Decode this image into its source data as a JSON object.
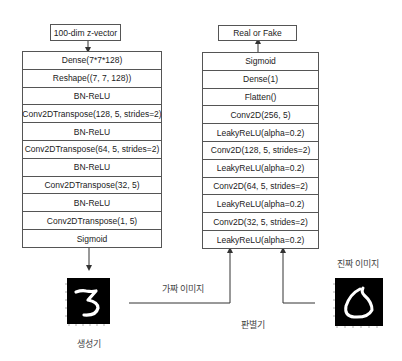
{
  "generator": {
    "input_label": "100-dim z-vector",
    "layers": [
      "Dense(7*7*128)",
      "Reshape((7, 7, 128))",
      "BN-ReLU",
      "Conv2DTranspose(128, 5, strides=2)",
      "BN-ReLU",
      "Conv2DTranspose(64, 5, strides=2)",
      "BN-ReLU",
      "Conv2DTranspose(32, 5)",
      "BN-ReLU",
      "Conv2DTranspose(1, 5)",
      "Sigmoid"
    ],
    "caption": "생성기",
    "output_image": {
      "digit": "3",
      "background": "#000000",
      "stroke": "#ffffff"
    }
  },
  "discriminator": {
    "output_label": "Real or Fake",
    "layers": [
      "Sigmoid",
      "Dense(1)",
      "Flatten()",
      "Conv2D(256, 5)",
      "LeakyReLU(alpha=0.2)",
      "Conv2D(128, 5, strides=2)",
      "LeakyReLU(alpha=0.2)",
      "Conv2D(64, 5, strides=2)",
      "LeakyReLU(alpha=0.2)",
      "Conv2D(32, 5, strides=2)",
      "LeakyReLU(alpha=0.2)"
    ],
    "caption": "판별기"
  },
  "fake_image_label": "가짜 이미지",
  "real_image": {
    "label": "진짜 이미지",
    "digit": "6",
    "background": "#000000",
    "stroke": "#ffffff"
  },
  "colors": {
    "line": "#333333",
    "border": "#555555"
  }
}
